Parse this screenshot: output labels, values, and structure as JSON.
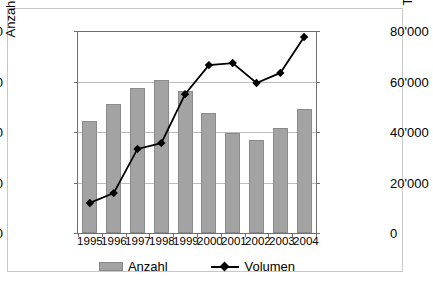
{
  "chart_data": {
    "type": "bar",
    "title": "",
    "xlabel": "",
    "ylabel": "Anzahl Transaktionen",
    "ylabel_secondary": "Transaktionsvolumen",
    "categories": [
      "1995",
      "1996",
      "1997",
      "1998",
      "1999",
      "2000",
      "2001",
      "2002",
      "2003",
      "2004"
    ],
    "ylim": [
      0,
      800
    ],
    "ylim_secondary": [
      0,
      80000
    ],
    "yticks": [
      "0",
      "200",
      "400",
      "600",
      "800"
    ],
    "ytick_values": [
      0,
      200,
      400,
      600,
      800
    ],
    "yticks_secondary": [
      "0",
      "20'000",
      "40'000",
      "60'000",
      "80'000"
    ],
    "ytick_values_secondary": [
      0,
      20000,
      40000,
      60000,
      80000
    ],
    "grid": true,
    "legend_position": "bottom",
    "series": [
      {
        "name": "Anzahl",
        "type": "bar",
        "axis": "left",
        "color": "#a3a3a3",
        "values": [
          445,
          510,
          575,
          607,
          563,
          477,
          396,
          368,
          416,
          492
        ]
      },
      {
        "name": "Volumen",
        "type": "line",
        "axis": "right",
        "color": "#000000",
        "marker": "diamond",
        "values": [
          11900,
          15800,
          33300,
          35600,
          55000,
          66500,
          67300,
          59400,
          63400,
          77600
        ]
      }
    ]
  },
  "legend": {
    "items": [
      {
        "label": "Anzahl",
        "swatch": "bar-swatch"
      },
      {
        "label": "Volumen",
        "swatch": "line-diamond-swatch"
      }
    ]
  },
  "axes": {
    "left": {
      "title": "Anzahl Transaktionen",
      "ticks": [
        "800",
        "600",
        "400",
        "200",
        "0"
      ]
    },
    "right": {
      "title": "Transaktionsvolumen",
      "ticks": [
        "80'000",
        "60'000",
        "40'000",
        "20'000",
        "0"
      ]
    },
    "bottom": {
      "ticks": [
        "1995",
        "1996",
        "1997",
        "1998",
        "1999",
        "2000",
        "2001",
        "2002",
        "2003",
        "2004"
      ]
    }
  }
}
